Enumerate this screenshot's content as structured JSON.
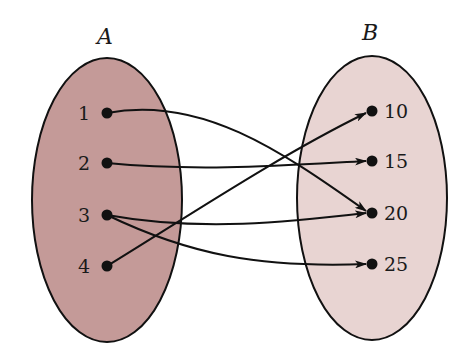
{
  "diagram": {
    "type": "mapping-diagram",
    "sets": [
      {
        "name": "A",
        "fill": "#c49a98",
        "elements": [
          "1",
          "2",
          "3",
          "4"
        ]
      },
      {
        "name": "B",
        "fill": "#e8d4d2",
        "elements": [
          "10",
          "15",
          "20",
          "25"
        ]
      }
    ],
    "mappings": [
      {
        "from": "1",
        "to": "20"
      },
      {
        "from": "2",
        "to": "15"
      },
      {
        "from": "3",
        "to": "20"
      },
      {
        "from": "3",
        "to": "25"
      },
      {
        "from": "4",
        "to": "10"
      }
    ]
  }
}
